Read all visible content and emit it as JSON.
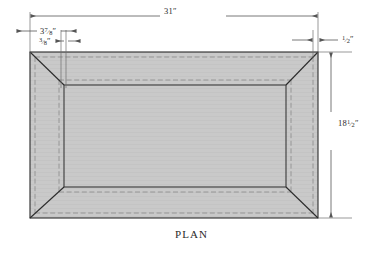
{
  "drawing": {
    "caption": "PLAN",
    "view_type": "plan",
    "subject": "mitered rectangular frame / tray plan view",
    "fill_color": "#c9c9c9",
    "line_color": "#2b2b2b",
    "dimension_line_color": "#555555",
    "hidden_line_color": "#8a8a8a",
    "dimensions": [
      {
        "name": "overall-width",
        "value": "31",
        "unit": "″",
        "display": "31″",
        "orientation": "horizontal",
        "position": "top"
      },
      {
        "name": "corner-offset-outer",
        "value": "3 7/8",
        "whole": "3",
        "numerator": "7",
        "denominator": "8",
        "unit": "″",
        "display": "3⁷⁄₈″",
        "orientation": "horizontal",
        "position": "top-left"
      },
      {
        "name": "rail-thickness",
        "value": "3/8",
        "whole": "",
        "numerator": "3",
        "denominator": "8",
        "unit": "″",
        "display": "³⁄₈″",
        "orientation": "horizontal",
        "position": "top-left"
      },
      {
        "name": "edge-offset",
        "value": "1/2",
        "whole": "",
        "numerator": "1",
        "denominator": "2",
        "unit": "″",
        "display": "¹⁄₂″",
        "orientation": "horizontal",
        "position": "top-right"
      },
      {
        "name": "overall-depth",
        "value": "18 1/2",
        "whole": "18",
        "numerator": "1",
        "denominator": "2",
        "unit": "″",
        "display": "18¹⁄₂″",
        "orientation": "vertical",
        "position": "right"
      }
    ],
    "geometry": {
      "outer_rect": {
        "x": 30,
        "y": 52,
        "width": 288,
        "height": 166
      },
      "inner_rect": {
        "x": 64,
        "y": 85,
        "width": 222,
        "height": 102
      },
      "miter_corners": 4,
      "hidden_line_inset": 5
    }
  }
}
